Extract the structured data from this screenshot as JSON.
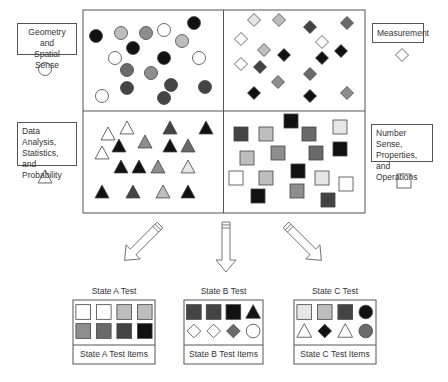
{
  "categories": [
    {
      "id": "geometry",
      "label_lines": [
        "Geometry and",
        "Spatial Sense"
      ],
      "shape": "circle",
      "box": [
        17,
        23,
        60,
        32
      ],
      "icon": [
        45,
        69
      ]
    },
    {
      "id": "measurement",
      "label_lines": [
        "Measurement"
      ],
      "shape": "diamond",
      "box": [
        372,
        23,
        52,
        20
      ],
      "icon": [
        402,
        55
      ]
    },
    {
      "id": "data",
      "label_lines": [
        "Data Analysis,",
        "Statistics, and",
        "Probability"
      ],
      "shape": "triangle",
      "box": [
        17,
        122,
        60,
        44
      ],
      "icon": [
        45,
        177
      ]
    },
    {
      "id": "number",
      "label_lines": [
        "Number Sense,",
        "Properties, and",
        "Operations"
      ],
      "shape": "square",
      "box": [
        371,
        124,
        62,
        38
      ],
      "icon": [
        404,
        181
      ]
    }
  ],
  "colors": {
    "white": "#ffffff",
    "vlight": "#e6e6e6",
    "light": "#bdbdbd",
    "mid": "#8e8e8e",
    "middark": "#6a6a6a",
    "dark": "#444444",
    "black": "#111111"
  },
  "pool": {
    "frame": [
      83,
      10,
      282,
      203
    ],
    "circles": [
      [
        96,
        36,
        "black"
      ],
      [
        121,
        33,
        "light"
      ],
      [
        146,
        33,
        "mid"
      ],
      [
        164,
        30,
        "white"
      ],
      [
        194,
        23,
        "black"
      ],
      [
        133,
        48,
        "black"
      ],
      [
        182,
        41,
        "light"
      ],
      [
        115,
        58,
        "white"
      ],
      [
        164,
        58,
        "black"
      ],
      [
        199,
        58,
        "white"
      ],
      [
        127,
        70,
        "middark"
      ],
      [
        151,
        73,
        "mid"
      ],
      [
        102,
        96,
        "white"
      ],
      [
        127,
        88,
        "dark"
      ],
      [
        171,
        85,
        "dark"
      ],
      [
        205,
        87,
        "dark"
      ],
      [
        164,
        98,
        "dark"
      ]
    ],
    "diamonds": [
      [
        254,
        20,
        "vlight"
      ],
      [
        279,
        20,
        "light"
      ],
      [
        310,
        27,
        "dark"
      ],
      [
        347,
        23,
        "middark"
      ],
      [
        241,
        39,
        "white"
      ],
      [
        264,
        50,
        "light"
      ],
      [
        284,
        55,
        "black"
      ],
      [
        322,
        42,
        "white"
      ],
      [
        341,
        51,
        "black"
      ],
      [
        322,
        58,
        "black"
      ],
      [
        241,
        64,
        "white"
      ],
      [
        260,
        67,
        "dark"
      ],
      [
        278,
        82,
        "mid"
      ],
      [
        310,
        74,
        "middark"
      ],
      [
        254,
        93,
        "black"
      ],
      [
        310,
        96,
        "black"
      ],
      [
        347,
        93,
        "mid"
      ]
    ],
    "triangles": [
      [
        108,
        134,
        "white"
      ],
      [
        127,
        128,
        "white"
      ],
      [
        170,
        128,
        "dark"
      ],
      [
        206,
        128,
        "black"
      ],
      [
        119,
        146,
        "black"
      ],
      [
        145,
        142,
        "mid"
      ],
      [
        170,
        146,
        "black"
      ],
      [
        188,
        146,
        "middark"
      ],
      [
        102,
        153,
        "white"
      ],
      [
        121,
        167,
        "black"
      ],
      [
        139,
        167,
        "black"
      ],
      [
        158,
        167,
        "mid"
      ],
      [
        188,
        167,
        "vlight"
      ],
      [
        102,
        192,
        "black"
      ],
      [
        133,
        192,
        "dark"
      ],
      [
        163,
        192,
        "light"
      ],
      [
        188,
        192,
        "black"
      ]
    ],
    "squares": [
      [
        291,
        121,
        "black"
      ],
      [
        241,
        134,
        "dark"
      ],
      [
        266,
        134,
        "light"
      ],
      [
        309,
        134,
        "middark"
      ],
      [
        340,
        127,
        "vlight"
      ],
      [
        278,
        153,
        "mid"
      ],
      [
        316,
        153,
        "middark"
      ],
      [
        340,
        149,
        "black"
      ],
      [
        247,
        158,
        "light"
      ],
      [
        236,
        178,
        "white"
      ],
      [
        266,
        178,
        "light"
      ],
      [
        298,
        171,
        "black"
      ],
      [
        322,
        178,
        "vlight"
      ],
      [
        346,
        184,
        "white"
      ],
      [
        258,
        196,
        "black"
      ],
      [
        297,
        191,
        "mid"
      ],
      [
        328,
        200,
        "dark"
      ]
    ]
  },
  "arrows": [
    {
      "id": "to-state-a",
      "angle": 45,
      "x": 160,
      "y": 225
    },
    {
      "id": "to-state-b",
      "angle": 0,
      "x": 226,
      "y": 222
    },
    {
      "id": "to-state-c",
      "angle": -45,
      "x": 286,
      "y": 225
    }
  ],
  "tests": [
    {
      "id": "state-a",
      "title": "State A Test",
      "footer": "State A Test Items",
      "box": [
        73,
        300,
        82,
        64
      ],
      "items": [
        [
          "square",
          "white"
        ],
        [
          "square",
          "white"
        ],
        [
          "square",
          "light"
        ],
        [
          "square",
          "light"
        ],
        [
          "square",
          "mid"
        ],
        [
          "square",
          "middark"
        ],
        [
          "square",
          "dark"
        ],
        [
          "square",
          "black"
        ]
      ]
    },
    {
      "id": "state-b",
      "title": "State B Test",
      "footer": "State B Test Items",
      "box": [
        184,
        300,
        79,
        64
      ],
      "items": [
        [
          "square",
          "dark"
        ],
        [
          "square",
          "dark"
        ],
        [
          "square",
          "black"
        ],
        [
          "triangle",
          "black"
        ],
        [
          "diamond",
          "white"
        ],
        [
          "diamond",
          "white"
        ],
        [
          "diamond",
          "middark"
        ],
        [
          "circle",
          "white"
        ]
      ]
    },
    {
      "id": "state-c",
      "title": "State C Test",
      "footer": "State C Test Items",
      "box": [
        294,
        300,
        82,
        64
      ],
      "items": [
        [
          "square",
          "vlight"
        ],
        [
          "square",
          "light"
        ],
        [
          "square",
          "dark"
        ],
        [
          "circle",
          "black"
        ],
        [
          "triangle",
          "white"
        ],
        [
          "diamond",
          "black"
        ],
        [
          "triangle",
          "white"
        ],
        [
          "circle",
          "middark"
        ]
      ]
    }
  ]
}
